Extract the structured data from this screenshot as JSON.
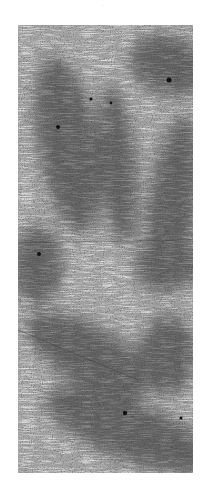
{
  "image": {
    "kind": "grayscale-dendritic-texture",
    "background": "#ffffff",
    "base_tone": "#b8b8b8",
    "dark_tone": "#3a3a3a",
    "top_mark": "·",
    "panel": {
      "x": 18,
      "y": 25,
      "width": 175,
      "height": 448
    },
    "dark_regions": [
      {
        "cx": 150,
        "cy": 40,
        "rx": 40,
        "ry": 30,
        "rot": 20
      },
      {
        "cx": 50,
        "cy": 120,
        "rx": 30,
        "ry": 90,
        "rot": -10
      },
      {
        "cx": 100,
        "cy": 140,
        "rx": 18,
        "ry": 80,
        "rot": -5
      },
      {
        "cx": 155,
        "cy": 180,
        "rx": 25,
        "ry": 90,
        "rot": 8
      },
      {
        "cx": 20,
        "cy": 240,
        "rx": 25,
        "ry": 40,
        "rot": 0
      },
      {
        "cx": 150,
        "cy": 240,
        "rx": 35,
        "ry": 25,
        "rot": 0
      },
      {
        "cx": 70,
        "cy": 330,
        "rx": 70,
        "ry": 30,
        "rot": 30
      },
      {
        "cx": 150,
        "cy": 330,
        "rx": 30,
        "ry": 40,
        "rot": 0
      },
      {
        "cx": 110,
        "cy": 405,
        "rx": 90,
        "ry": 30,
        "rot": 22
      }
    ],
    "spots": [
      {
        "x": 151,
        "y": 55,
        "r": 2.5
      },
      {
        "x": 73,
        "y": 74,
        "r": 1.6
      },
      {
        "x": 93,
        "y": 78,
        "r": 1.4
      },
      {
        "x": 40,
        "y": 102,
        "r": 2
      },
      {
        "x": 21,
        "y": 229,
        "r": 2
      },
      {
        "x": 107,
        "y": 388,
        "r": 2.2
      },
      {
        "x": 163,
        "y": 393,
        "r": 1.5
      }
    ],
    "lines": [
      {
        "x1": 0,
        "y1": 218,
        "x2": 175,
        "y2": 215
      },
      {
        "x1": 0,
        "y1": 305,
        "x2": 120,
        "y2": 355
      }
    ]
  }
}
